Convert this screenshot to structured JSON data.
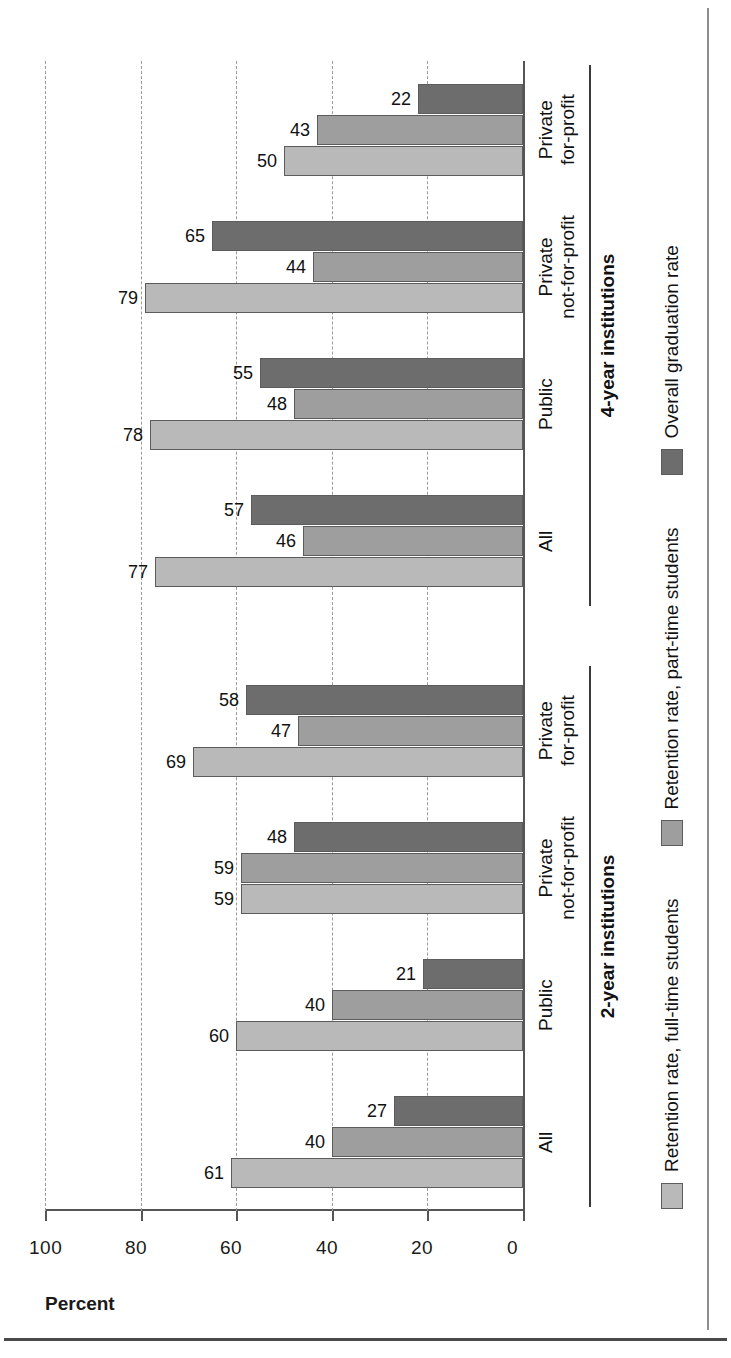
{
  "chart_data": {
    "type": "bar",
    "orientation": "vertical",
    "title": "",
    "xlabel": "",
    "ylabel": "Percent",
    "ylim": [
      0,
      100
    ],
    "yticks": [
      0,
      20,
      40,
      60,
      80,
      100
    ],
    "ytick_labels": [
      "0",
      "20",
      "40",
      "60",
      "80",
      "100"
    ],
    "grid": "dashed horizontal gridlines",
    "legend_position": "bottom",
    "series": [
      {
        "name": "Retention rate, full-time students",
        "color": "#b9b9b9",
        "values": [
          61,
          60,
          59,
          69,
          77,
          78,
          79,
          50
        ]
      },
      {
        "name": "Retention rate, part-time students",
        "color": "#9e9e9e",
        "values": [
          40,
          40,
          59,
          47,
          46,
          48,
          44,
          43
        ]
      },
      {
        "name": "Overall graduation rate",
        "color": "#6d6d6d",
        "values": [
          27,
          21,
          48,
          58,
          57,
          55,
          65,
          22
        ]
      }
    ],
    "categories": [
      "All",
      "Public",
      "Private\nnot-for-profit",
      "Private\nfor-profit",
      "All",
      "Public",
      "Private\nnot-for-profit",
      "Private\nfor-profit"
    ],
    "sections": [
      {
        "label": "2-year institutions",
        "categories": [
          0,
          1,
          2,
          3
        ]
      },
      {
        "label": "4-year institutions",
        "categories": [
          4,
          5,
          6,
          7
        ]
      }
    ]
  },
  "axis": {
    "title": "Percent",
    "ticks": [
      "0",
      "20",
      "40",
      "60",
      "80",
      "100"
    ]
  },
  "sections": [
    {
      "label": "2-year institutions"
    },
    {
      "label": "4-year institutions"
    }
  ],
  "categories": [
    {
      "label": "All"
    },
    {
      "label": "Public"
    },
    {
      "label": "Private\nnot-for-profit"
    },
    {
      "label": "Private\nfor-profit"
    },
    {
      "label": "All"
    },
    {
      "label": "Public"
    },
    {
      "label": "Private\nnot-for-profit"
    },
    {
      "label": "Private\nfor-profit"
    }
  ],
  "legend": {
    "items": [
      {
        "label": "Retention rate, full-time students",
        "color": "#b9b9b9"
      },
      {
        "label": "Retention rate, part-time students",
        "color": "#9e9e9e"
      },
      {
        "label": "Overall graduation rate",
        "color": "#6d6d6d"
      }
    ]
  },
  "bar_labels": {
    "g0": [
      "61",
      "40",
      "27"
    ],
    "g1": [
      "60",
      "40",
      "21"
    ],
    "g2": [
      "59",
      "59",
      "48"
    ],
    "g3": [
      "69",
      "47",
      "58"
    ],
    "g4": [
      "77",
      "46",
      "57"
    ],
    "g5": [
      "78",
      "48",
      "55"
    ],
    "g6": [
      "79",
      "44",
      "65"
    ],
    "g7": [
      "50",
      "43",
      "22"
    ]
  }
}
